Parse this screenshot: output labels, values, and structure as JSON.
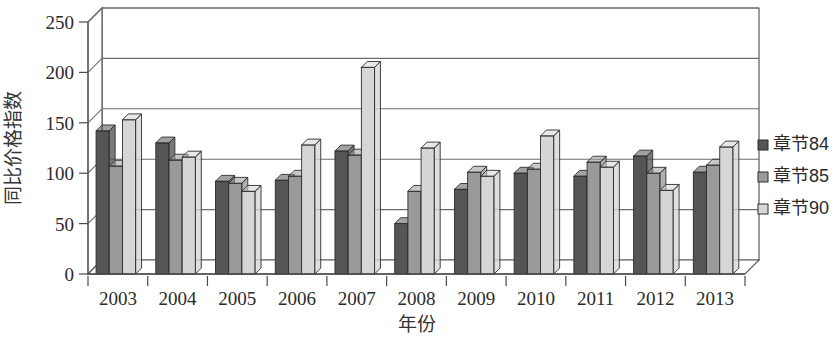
{
  "chart_data": {
    "type": "bar",
    "title": "",
    "subtitle": "",
    "xlabel": "年份",
    "ylabel": "同比价格指数",
    "categories": [
      "2003",
      "2004",
      "2005",
      "2006",
      "2007",
      "2008",
      "2009",
      "2010",
      "2011",
      "2012",
      "2013"
    ],
    "series": [
      {
        "name": "章节84",
        "color": "#555555",
        "values": [
          142,
          130,
          92,
          93,
          122,
          50,
          84,
          100,
          97,
          117,
          101
        ]
      },
      {
        "name": "章节85",
        "color": "#9a9a9a",
        "values": [
          107,
          113,
          90,
          97,
          118,
          82,
          101,
          104,
          111,
          100,
          108
        ]
      },
      {
        "name": "章节90",
        "color": "#d6d6d6",
        "values": [
          153,
          116,
          82,
          128,
          205,
          125,
          97,
          137,
          106,
          83,
          126
        ]
      }
    ],
    "ylim": [
      0,
      250
    ],
    "yticks": [
      0,
      50,
      100,
      150,
      200,
      250
    ],
    "ytick_labels": [
      "0",
      "50",
      "100",
      "150",
      "200",
      "250"
    ],
    "grid": true,
    "grid_axis": "y",
    "legend_position": "right",
    "style": "3d-column",
    "background": "#ffffff"
  },
  "legend": {
    "items": [
      {
        "label": "章节84",
        "swatch": "#555555"
      },
      {
        "label": "章节85",
        "swatch": "#9a9a9a"
      },
      {
        "label": "章节90",
        "swatch": "#d6d6d6"
      }
    ]
  },
  "axes": {
    "y_title": "同比价格指数",
    "x_title": "年份",
    "y_ticks": [
      "250",
      "200",
      "150",
      "100",
      "50",
      "0"
    ],
    "x_ticks": [
      "2003",
      "2004",
      "2005",
      "2006",
      "2007",
      "2008",
      "2009",
      "2010",
      "2011",
      "2012",
      "2013"
    ]
  },
  "colors": {
    "series_84": "#555555",
    "series_85": "#9a9a9a",
    "series_90": "#d6d6d6",
    "axis": "#4a4a4a",
    "grid": "#6d6d6d",
    "text": "#2b2b2b",
    "background": "#ffffff"
  }
}
